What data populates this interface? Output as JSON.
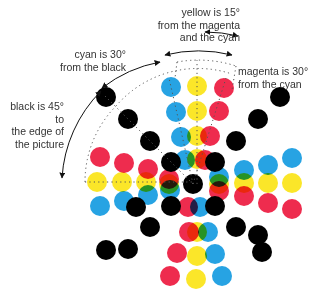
{
  "annotations": {
    "yellow": [
      "yellow is 15°",
      "from the magenta",
      "and the cyan"
    ],
    "cyan": [
      "cyan is 30°",
      "from the black"
    ],
    "magenta": [
      "magenta is 30°",
      "from the cyan"
    ],
    "black": [
      "black is 45° to",
      "the edge of",
      "the picture"
    ]
  },
  "colors": {
    "cyan": "#27a3e3",
    "magenta": "#ee2c4e",
    "yellow": "#fbe629",
    "black": "#000000",
    "overlap_green": "#1e8a3e",
    "text": "#333333"
  },
  "center": [
    193,
    184
  ],
  "dot_radius": 10,
  "dots": [
    {
      "c": "black",
      "x": 193,
      "y": 184
    },
    {
      "c": "black",
      "x": 171,
      "y": 162
    },
    {
      "c": "black",
      "x": 215,
      "y": 162
    },
    {
      "c": "black",
      "x": 171,
      "y": 206
    },
    {
      "c": "black",
      "x": 215,
      "y": 206
    },
    {
      "c": "black",
      "x": 150,
      "y": 141
    },
    {
      "c": "black",
      "x": 128,
      "y": 119
    },
    {
      "c": "black",
      "x": 106,
      "y": 97
    },
    {
      "c": "black",
      "x": 236,
      "y": 141
    },
    {
      "c": "black",
      "x": 258,
      "y": 119
    },
    {
      "c": "black",
      "x": 280,
      "y": 97
    },
    {
      "c": "black",
      "x": 150,
      "y": 227
    },
    {
      "c": "black",
      "x": 128,
      "y": 249
    },
    {
      "c": "black",
      "x": 106,
      "y": 250
    },
    {
      "c": "black",
      "x": 236,
      "y": 227
    },
    {
      "c": "black",
      "x": 258,
      "y": 235
    },
    {
      "c": "black",
      "x": 262,
      "y": 252
    },
    {
      "c": "black",
      "x": 136,
      "y": 207
    },
    {
      "c": "cyan",
      "x": 171,
      "y": 87
    },
    {
      "c": "cyan",
      "x": 176,
      "y": 112
    },
    {
      "c": "cyan",
      "x": 181,
      "y": 137
    },
    {
      "c": "cyan",
      "x": 185,
      "y": 160
    },
    {
      "c": "yellow",
      "x": 197,
      "y": 86
    },
    {
      "c": "yellow",
      "x": 197,
      "y": 111
    },
    {
      "c": "yellow",
      "x": 197,
      "y": 136
    },
    {
      "c": "yellow",
      "x": 197,
      "y": 159
    },
    {
      "c": "magenta",
      "x": 224,
      "y": 88
    },
    {
      "c": "magenta",
      "x": 219,
      "y": 111
    },
    {
      "c": "magenta",
      "x": 210,
      "y": 136
    },
    {
      "c": "magenta",
      "x": 205,
      "y": 160
    },
    {
      "c": "magenta",
      "x": 100,
      "y": 157
    },
    {
      "c": "magenta",
      "x": 124,
      "y": 163
    },
    {
      "c": "magenta",
      "x": 148,
      "y": 169
    },
    {
      "c": "magenta",
      "x": 169,
      "y": 179
    },
    {
      "c": "yellow",
      "x": 97,
      "y": 182
    },
    {
      "c": "yellow",
      "x": 122,
      "y": 182
    },
    {
      "c": "yellow",
      "x": 146,
      "y": 182
    },
    {
      "c": "yellow",
      "x": 169,
      "y": 184
    },
    {
      "c": "cyan",
      "x": 100,
      "y": 206
    },
    {
      "c": "cyan",
      "x": 124,
      "y": 201
    },
    {
      "c": "cyan",
      "x": 148,
      "y": 195
    },
    {
      "c": "cyan",
      "x": 170,
      "y": 190
    },
    {
      "c": "cyan",
      "x": 244,
      "y": 170
    },
    {
      "c": "cyan",
      "x": 268,
      "y": 165
    },
    {
      "c": "cyan",
      "x": 292,
      "y": 158
    },
    {
      "c": "cyan",
      "x": 219,
      "y": 177
    },
    {
      "c": "yellow",
      "x": 244,
      "y": 183
    },
    {
      "c": "yellow",
      "x": 268,
      "y": 183
    },
    {
      "c": "yellow",
      "x": 292,
      "y": 183
    },
    {
      "c": "yellow",
      "x": 219,
      "y": 184
    },
    {
      "c": "magenta",
      "x": 244,
      "y": 196
    },
    {
      "c": "magenta",
      "x": 268,
      "y": 203
    },
    {
      "c": "magenta",
      "x": 292,
      "y": 209
    },
    {
      "c": "magenta",
      "x": 219,
      "y": 191
    },
    {
      "c": "magenta",
      "x": 189,
      "y": 232
    },
    {
      "c": "yellow",
      "x": 197,
      "y": 232
    },
    {
      "c": "cyan",
      "x": 208,
      "y": 232
    },
    {
      "c": "magenta",
      "x": 177,
      "y": 253
    },
    {
      "c": "yellow",
      "x": 197,
      "y": 256
    },
    {
      "c": "cyan",
      "x": 215,
      "y": 254
    },
    {
      "c": "magenta",
      "x": 170,
      "y": 276
    },
    {
      "c": "yellow",
      "x": 196,
      "y": 279
    },
    {
      "c": "cyan",
      "x": 222,
      "y": 276
    },
    {
      "c": "magenta",
      "x": 188,
      "y": 207
    },
    {
      "c": "cyan",
      "x": 200,
      "y": 207
    }
  ]
}
